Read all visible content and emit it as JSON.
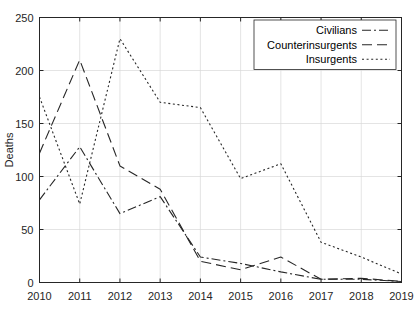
{
  "chart_data": {
    "type": "line",
    "title": "",
    "xlabel": "",
    "ylabel": "Deaths",
    "x": [
      2010,
      2011,
      2012,
      2013,
      2014,
      2015,
      2016,
      2017,
      2018,
      2019
    ],
    "xtick_labels": [
      "2010",
      "2011",
      "2012",
      "2013",
      "2014",
      "2015",
      "2016",
      "2017",
      "2018",
      "2019"
    ],
    "ytick_labels": [
      "0",
      "50",
      "100",
      "150",
      "200",
      "250"
    ],
    "yticks": [
      0,
      50,
      100,
      150,
      200,
      250
    ],
    "xlim": [
      2010,
      2019
    ],
    "ylim": [
      0,
      250
    ],
    "grid": true,
    "legend_position": "top-right",
    "series": [
      {
        "name": "Civilians",
        "linestyle": "dash-dot",
        "color": "#262626",
        "values": [
          78,
          128,
          65,
          81,
          24,
          18,
          10,
          3,
          3,
          1
        ]
      },
      {
        "name": "Counterinsurgents",
        "linestyle": "long-dash",
        "color": "#262626",
        "values": [
          122,
          210,
          110,
          88,
          20,
          12,
          24,
          3,
          4,
          1
        ]
      },
      {
        "name": "Insurgents",
        "linestyle": "dotted",
        "color": "#262626",
        "values": [
          175,
          74,
          230,
          170,
          165,
          98,
          112,
          38,
          24,
          8
        ]
      }
    ]
  },
  "legend": {
    "entries": [
      {
        "label": "Civilians"
      },
      {
        "label": "Counterinsurgents"
      },
      {
        "label": "Insurgents"
      }
    ]
  },
  "axes": {
    "y_axis_title": "Deaths"
  }
}
